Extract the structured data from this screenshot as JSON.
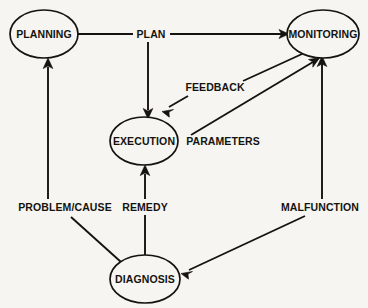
{
  "diagram": {
    "type": "directed-graph",
    "background_color": "#f6f5f1",
    "line_color": "#15130f",
    "nodes": [
      {
        "id": "planning",
        "label": "PLANNING",
        "shape": "ellipse",
        "cx": 44,
        "cy": 34,
        "rx": 34,
        "ry": 24
      },
      {
        "id": "monitoring",
        "label": "MONITORING",
        "shape": "ellipse",
        "cx": 323,
        "cy": 34,
        "rx": 36,
        "ry": 24
      },
      {
        "id": "execution",
        "label": "EXECUTION",
        "shape": "ellipse",
        "cx": 144,
        "cy": 141,
        "rx": 34,
        "ry": 24
      },
      {
        "id": "diagnosis",
        "label": "DIAGNOSIS",
        "shape": "ellipse",
        "cx": 145,
        "cy": 279,
        "rx": 35,
        "ry": 24
      }
    ],
    "edges": [
      {
        "id": "plan",
        "label": "PLAN",
        "from": "planning",
        "to": "monitoring",
        "label_x": 151,
        "label_y": 34
      },
      {
        "id": "plan-exec",
        "label": "",
        "from": "plan",
        "to": "execution"
      },
      {
        "id": "feedback",
        "label": "FEEDBACK",
        "from": "monitoring",
        "to": "execution",
        "label_x": 215,
        "label_y": 87
      },
      {
        "id": "parameters",
        "label": "PARAMETERS",
        "from": "execution",
        "to": "monitoring",
        "label_x": 223,
        "label_y": 141
      },
      {
        "id": "malfunction",
        "label": "MALFUNCTION",
        "from": "diagnosis",
        "to": "monitoring",
        "label_x": 320,
        "label_y": 207
      },
      {
        "id": "remedy",
        "label": "REMEDY",
        "from": "diagnosis",
        "to": "execution",
        "label_x": 145,
        "label_y": 207
      },
      {
        "id": "problem-cause",
        "label": "PROBLEM/CAUSE",
        "from": "diagnosis",
        "to": "planning",
        "label_x": 65,
        "label_y": 207
      }
    ]
  }
}
